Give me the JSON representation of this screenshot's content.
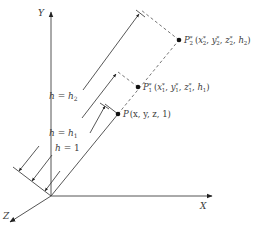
{
  "diagram": {
    "axes": {
      "x_label": "X",
      "y_label": "Y",
      "z_label": "Z"
    },
    "points": [
      {
        "id": "P",
        "name": "P",
        "sub": "",
        "sup": "",
        "coords": "(x, y, z, 1)"
      },
      {
        "id": "P1",
        "name": "P",
        "sub": "1",
        "sup": "*",
        "coords_parts": [
          "(x",
          "1",
          "*",
          ", y",
          "1",
          "*",
          ", z",
          "1",
          "*",
          ", h",
          "1",
          ")"
        ]
      },
      {
        "id": "P2",
        "name": "P",
        "sub": "2",
        "sup": "*",
        "coords_parts": [
          "(x",
          "2",
          "*",
          ", y",
          "2",
          "*",
          ", z",
          "2",
          "*",
          ", h",
          "2",
          ")"
        ]
      }
    ],
    "dimensions": [
      {
        "id": "h1",
        "label_left": "h = 1",
        "label_h": "h",
        "label_eq": " = ",
        "label_val": "1",
        "label_sub": ""
      },
      {
        "id": "hh1",
        "label_h": "h",
        "label_eq": " = ",
        "label_val": "h",
        "label_sub": "1"
      },
      {
        "id": "hh2",
        "label_h": "h",
        "label_eq": " = ",
        "label_val": "h",
        "label_sub": "2"
      }
    ],
    "colors": {
      "ink": "#3a3a3a",
      "background": "#ffffff"
    }
  }
}
